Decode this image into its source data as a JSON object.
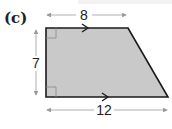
{
  "figure": {
    "part_label": "(c)",
    "shape": "right trapezoid",
    "dimensions": {
      "top": "8",
      "height": "7",
      "bottom": "12"
    },
    "markers": [
      "right-angle top-left",
      "right-angle bottom-left",
      "parallel arrow top",
      "parallel arrow bottom"
    ],
    "colors": {
      "fill": "#c9c9c9",
      "stroke": "#1a1a1a",
      "dimension_line": "#9a9a9a"
    }
  }
}
